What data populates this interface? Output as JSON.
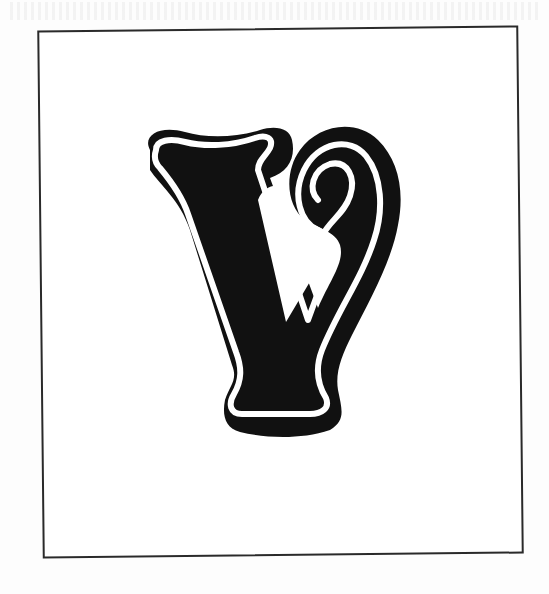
{
  "illustration": {
    "subject": "Decorative initial letter",
    "letter": "V",
    "style": "ornamental serif with drop shadow and white inline",
    "colors": {
      "ink": "#111111",
      "paper": "#ffffff",
      "frame": "#2a2a2a"
    }
  }
}
